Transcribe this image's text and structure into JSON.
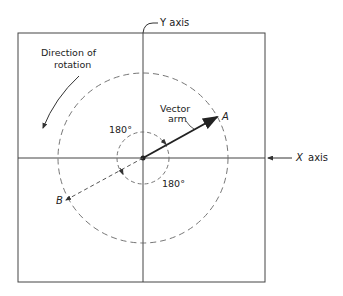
{
  "diagram": {
    "y_axis_label": "Y axis",
    "x_axis_label": "X axis",
    "rotation_label_line1": "Direction of",
    "rotation_label_line2": "rotation",
    "vector_label_line1": "Vector",
    "vector_label_line2": "arm",
    "point_a": "A",
    "point_b": "B",
    "angle_top": "180°",
    "angle_bottom": "180°",
    "colors": {
      "line": "#333333",
      "dashed": "#666666",
      "background": "#ffffff"
    }
  }
}
